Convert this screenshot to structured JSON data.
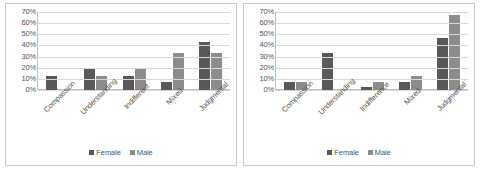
{
  "chart_data": [
    {
      "type": "bar",
      "name": "left-chart",
      "title": "",
      "xlabel": "",
      "ylabel": "",
      "categories": [
        "Compassion",
        "Understanding",
        "Indifferent",
        "Mixed",
        "Judgmental"
      ],
      "series": [
        {
          "name": "Female",
          "color": "#595959",
          "values": [
            13,
            20,
            13,
            7,
            43
          ]
        },
        {
          "name": "Male",
          "color": "#8c8c8c",
          "values": [
            0,
            13,
            20,
            33,
            33
          ]
        }
      ],
      "ylim": [
        0,
        70
      ],
      "ytick_step": 10,
      "ytick_labels": [
        "70%",
        "60%",
        "50%",
        "40%",
        "30%",
        "20%",
        "10%",
        "0%"
      ],
      "grid": true,
      "legend_position": "bottom"
    },
    {
      "type": "bar",
      "name": "right-chart",
      "title": "",
      "xlabel": "",
      "ylabel": "",
      "categories": [
        "Compassion",
        "Understanding",
        "Indifference",
        "Mixed",
        "Judgmental"
      ],
      "series": [
        {
          "name": "Female",
          "color": "#595959",
          "values": [
            7,
            33,
            3,
            7,
            47
          ]
        },
        {
          "name": "Male",
          "color": "#8c8c8c",
          "values": [
            7,
            0,
            7,
            13,
            67
          ]
        }
      ],
      "ylim": [
        0,
        70
      ],
      "ytick_step": 10,
      "ytick_labels": [
        "70%",
        "60%",
        "50%",
        "40%",
        "30%",
        "20%",
        "10%",
        "0%"
      ],
      "grid": true,
      "legend_position": "bottom"
    }
  ]
}
